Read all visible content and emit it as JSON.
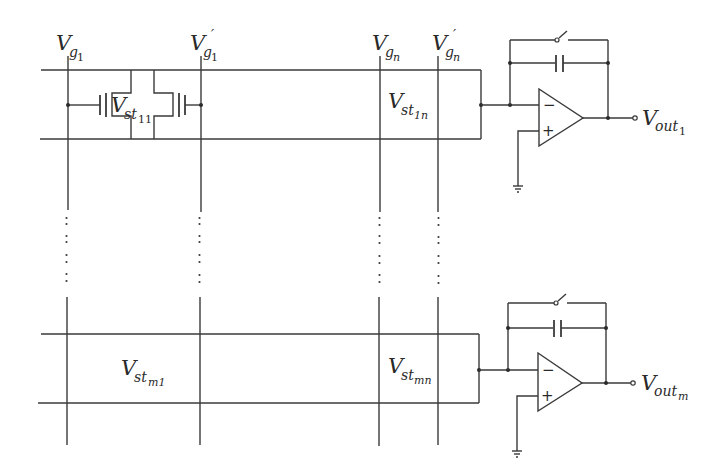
{
  "diagram": {
    "title": "",
    "columns": [
      {
        "id": "vg1",
        "label_main": "V",
        "label_sub": "g",
        "label_subsub": "1",
        "prime": "",
        "x": 68
      },
      {
        "id": "vg1p",
        "label_main": "V",
        "label_sub": "g",
        "label_subsub": "1",
        "prime": "′",
        "x": 201
      },
      {
        "id": "vgn",
        "label_main": "V",
        "label_sub": "g",
        "label_subsub": "n",
        "prime": "",
        "x": 380
      },
      {
        "id": "vgnp",
        "label_main": "V",
        "label_sub": "g",
        "label_subsub": "n",
        "prime": "′",
        "x": 438
      }
    ],
    "rows": [
      {
        "id": "row-1",
        "top_y": 70,
        "bottom_y": 139,
        "mid_y": 105,
        "cells": [
          {
            "id": "vst11",
            "label_main": "V",
            "label_sub": "st",
            "label_subsub": "11"
          },
          {
            "id": "vst1n",
            "label_main": "V",
            "label_sub": "st",
            "label_subsub": "1n"
          }
        ],
        "output": {
          "label_main": "V",
          "label_sub": "out",
          "label_subsub": "1"
        }
      },
      {
        "id": "row-m",
        "top_y": 334,
        "bottom_y": 404,
        "mid_y": 370,
        "cells": [
          {
            "id": "vstm1",
            "label_main": "V",
            "label_sub": "st",
            "label_subsub": "m1"
          },
          {
            "id": "vstmn",
            "label_main": "V",
            "label_sub": "st",
            "label_subsub": "mn"
          }
        ],
        "output": {
          "label_main": "V",
          "label_sub": "out",
          "label_subsub": "m"
        }
      }
    ],
    "opamp_signs": {
      "minus": "−",
      "plus": "+"
    },
    "ellipsis": "vertical dots indicating rows 2 … m−1",
    "colors": {
      "line": "#3a3a3a",
      "background": "#ffffff"
    }
  }
}
